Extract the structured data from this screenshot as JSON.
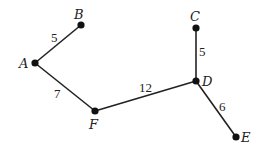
{
  "graph": {
    "nodes": [
      {
        "id": "A",
        "label": "A",
        "x": 35,
        "y": 63,
        "lx": 19,
        "ly": 68
      },
      {
        "id": "B",
        "label": "B",
        "x": 81,
        "y": 25,
        "lx": 74,
        "ly": 19
      },
      {
        "id": "C",
        "label": "C",
        "x": 196,
        "y": 28,
        "lx": 190,
        "ly": 21
      },
      {
        "id": "D",
        "label": "D",
        "x": 196,
        "y": 81,
        "lx": 202,
        "ly": 86
      },
      {
        "id": "E",
        "label": "E",
        "x": 236,
        "y": 137,
        "lx": 241,
        "ly": 142
      },
      {
        "id": "F",
        "label": "F",
        "x": 95,
        "y": 111,
        "lx": 89,
        "ly": 129
      }
    ],
    "edges": [
      {
        "from": "A",
        "to": "B",
        "weight": "5",
        "wx": 51,
        "wy": 42
      },
      {
        "from": "A",
        "to": "F",
        "weight": "7",
        "wx": 54,
        "wy": 98
      },
      {
        "from": "F",
        "to": "D",
        "weight": "12",
        "wx": 139,
        "wy": 92
      },
      {
        "from": "C",
        "to": "D",
        "weight": "5",
        "wx": 199,
        "wy": 56
      },
      {
        "from": "D",
        "to": "E",
        "weight": "6",
        "wx": 219,
        "wy": 111
      }
    ]
  }
}
